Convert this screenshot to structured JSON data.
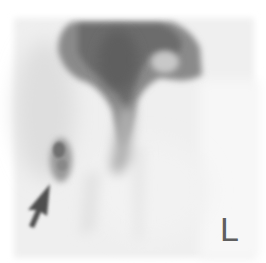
{
  "image": {
    "type": "nuclear medicine scintigraphy",
    "background_color": "#ffffff",
    "field_color": "#f0f0f0",
    "uptake_color": "#6a6a6a"
  },
  "annotations": {
    "arrow": {
      "icon": "arrow-up-right-icon",
      "color": "#4a4a4a"
    },
    "side_marker": "L"
  }
}
